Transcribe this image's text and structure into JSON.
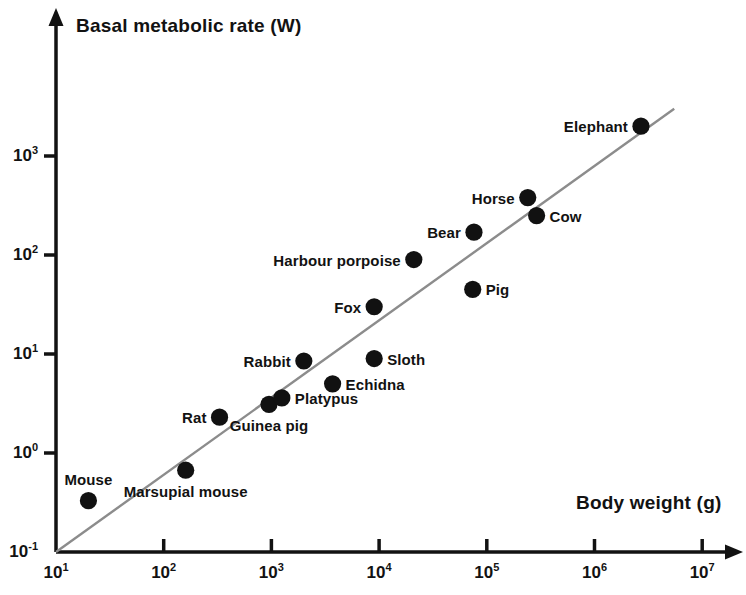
{
  "chart_data": {
    "type": "scatter",
    "title": "",
    "xlabel": "Body weight (g)",
    "ylabel": "Basal metabolic rate (W)",
    "xscale": "log",
    "yscale": "log",
    "xlim": [
      10,
      10000000
    ],
    "ylim": [
      0.1,
      10000
    ],
    "grid": false,
    "legend": "none",
    "xticks": [
      {
        "value": 10,
        "label_mantissa": "10",
        "label_exponent": "1"
      },
      {
        "value": 100,
        "label_mantissa": "10",
        "label_exponent": "2"
      },
      {
        "value": 1000,
        "label_mantissa": "10",
        "label_exponent": "3"
      },
      {
        "value": 10000,
        "label_mantissa": "10",
        "label_exponent": "4"
      },
      {
        "value": 100000,
        "label_mantissa": "10",
        "label_exponent": "5"
      },
      {
        "value": 1000000,
        "label_mantissa": "10",
        "label_exponent": "6"
      },
      {
        "value": 10000000,
        "label_mantissa": "10",
        "label_exponent": "7"
      }
    ],
    "yticks": [
      {
        "value": 0.1,
        "label_mantissa": "10",
        "label_exponent": "-1"
      },
      {
        "value": 1,
        "label_mantissa": "10",
        "label_exponent": "0"
      },
      {
        "value": 10,
        "label_mantissa": "10",
        "label_exponent": "1"
      },
      {
        "value": 100,
        "label_mantissa": "10",
        "label_exponent": "2"
      },
      {
        "value": 1000,
        "label_mantissa": "10",
        "label_exponent": "3"
      }
    ],
    "points": [
      {
        "name": "Mouse",
        "x": 20,
        "y": 0.33,
        "label_pos": "above"
      },
      {
        "name": "Marsupial mouse",
        "x": 160,
        "y": 0.67,
        "label_pos": "below"
      },
      {
        "name": "Rat",
        "x": 330,
        "y": 2.3,
        "label_pos": "left"
      },
      {
        "name": "Guinea pig",
        "x": 950,
        "y": 3.1,
        "label_pos": "below"
      },
      {
        "name": "Platypus",
        "x": 1250,
        "y": 3.6,
        "label_pos": "right"
      },
      {
        "name": "Rabbit",
        "x": 2000,
        "y": 8.5,
        "label_pos": "left"
      },
      {
        "name": "Echidna",
        "x": 3700,
        "y": 5.0,
        "label_pos": "right"
      },
      {
        "name": "Sloth",
        "x": 9000,
        "y": 9.0,
        "label_pos": "right"
      },
      {
        "name": "Fox",
        "x": 9000,
        "y": 30,
        "label_pos": "left"
      },
      {
        "name": "Harbour porpoise",
        "x": 21000,
        "y": 90,
        "label_pos": "left"
      },
      {
        "name": "Pig",
        "x": 74000,
        "y": 45,
        "label_pos": "right"
      },
      {
        "name": "Bear",
        "x": 76000,
        "y": 170,
        "label_pos": "left"
      },
      {
        "name": "Horse",
        "x": 240000,
        "y": 380,
        "label_pos": "left"
      },
      {
        "name": "Cow",
        "x": 290000,
        "y": 250,
        "label_pos": "right"
      },
      {
        "name": "Elephant",
        "x": 2700000,
        "y": 2000,
        "label_pos": "left"
      }
    ],
    "trendline": {
      "label": "allometric regression line",
      "x_start": 10,
      "y_start": 0.1,
      "x_end": 5500000,
      "y_end": 3000
    },
    "colors": {
      "point": "#111111",
      "axis": "#121212",
      "trendline": "#8c8c8c",
      "text": "#121212",
      "background": "#ffffff"
    }
  }
}
